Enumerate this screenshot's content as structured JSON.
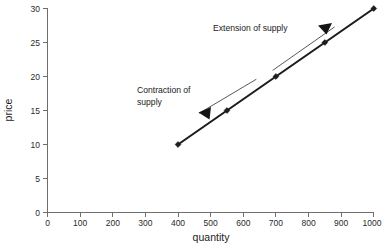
{
  "chart_data": {
    "type": "line",
    "title": "",
    "xlabel": "quantity",
    "ylabel": "price",
    "xlim": [
      0,
      1000
    ],
    "ylim": [
      0,
      30
    ],
    "grid": false,
    "legend": "none",
    "x_ticks": [
      0,
      100,
      200,
      300,
      400,
      500,
      600,
      700,
      800,
      900,
      1000
    ],
    "x_tick_labels": [
      "0",
      "100",
      "200",
      "300",
      "400",
      "500",
      "600",
      "700",
      "800",
      "900",
      "1000"
    ],
    "y_ticks": [
      0,
      5,
      10,
      15,
      20,
      25,
      30
    ],
    "y_tick_labels": [
      "0",
      "5",
      "10",
      "15",
      "20",
      "25",
      "30"
    ],
    "series": [
      {
        "name": "supply",
        "marker": "diamond",
        "x": [
          400,
          550,
          700,
          850,
          1000
        ],
        "values": [
          10,
          15,
          20,
          25,
          30
        ]
      }
    ],
    "annotations": [
      {
        "id": "extension",
        "text": "Extension of supply",
        "lines": [
          "Extension of supply"
        ],
        "direction": "up-right",
        "from": [
          690,
          20.9
        ],
        "to": [
          880,
          27.3
        ]
      },
      {
        "id": "contraction",
        "text": "Contraction of supply",
        "lines": [
          "Contraction of",
          "supply"
        ],
        "direction": "down-left",
        "from": [
          640,
          19.6
        ],
        "to": [
          465,
          14.6
        ]
      }
    ]
  },
  "axes": {
    "x_title": "quantity",
    "y_title": "price"
  },
  "colors": {
    "background": "#ffffff",
    "supply_line": "#1c1c1c",
    "axis": "#6e6e6e",
    "text": "#1a1a1a",
    "annotation": "#3a3a3a"
  },
  "labels": {
    "y": [
      "30",
      "25",
      "20",
      "15",
      "10",
      "5",
      "0"
    ],
    "x": [
      "0",
      "100",
      "200",
      "300",
      "400",
      "500",
      "600",
      "700",
      "800",
      "900",
      "1000"
    ],
    "extension_line1": "Extension of supply",
    "contraction_line1": "Contraction of",
    "contraction_line2": "supply"
  }
}
